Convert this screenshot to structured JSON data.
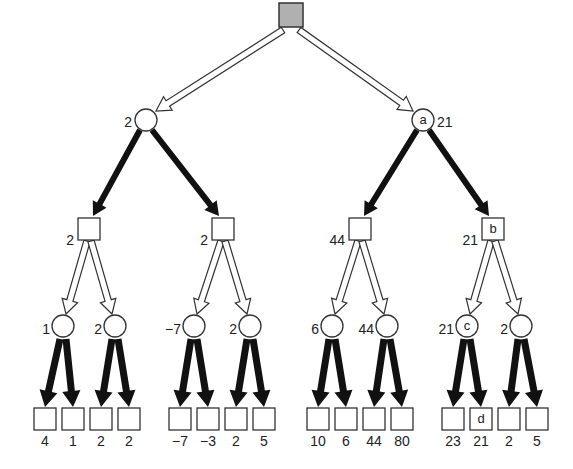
{
  "diagram": {
    "type": "minimax-game-tree",
    "root": {
      "shape": "square",
      "fill": "#b0b0b0"
    },
    "level1": [
      {
        "shape": "circle",
        "value": "2",
        "tag": ""
      },
      {
        "shape": "circle",
        "value": "21",
        "tag": "a"
      }
    ],
    "level2": [
      {
        "shape": "square",
        "value": "2",
        "tag": ""
      },
      {
        "shape": "square",
        "value": "2",
        "tag": ""
      },
      {
        "shape": "square",
        "value": "44",
        "tag": ""
      },
      {
        "shape": "square",
        "value": "21",
        "tag": "b"
      }
    ],
    "level3": [
      {
        "shape": "circle",
        "value": "1",
        "tag": ""
      },
      {
        "shape": "circle",
        "value": "2",
        "tag": ""
      },
      {
        "shape": "circle",
        "value": "−7",
        "tag": ""
      },
      {
        "shape": "circle",
        "value": "2",
        "tag": ""
      },
      {
        "shape": "circle",
        "value": "6",
        "tag": ""
      },
      {
        "shape": "circle",
        "value": "44",
        "tag": ""
      },
      {
        "shape": "circle",
        "value": "21",
        "tag": "c"
      },
      {
        "shape": "circle",
        "value": "2",
        "tag": ""
      }
    ],
    "leaves": [
      {
        "value": "4",
        "tag": ""
      },
      {
        "value": "1",
        "tag": ""
      },
      {
        "value": "2",
        "tag": ""
      },
      {
        "value": "2",
        "tag": ""
      },
      {
        "value": "−7",
        "tag": ""
      },
      {
        "value": "−3",
        "tag": ""
      },
      {
        "value": "2",
        "tag": ""
      },
      {
        "value": "5",
        "tag": ""
      },
      {
        "value": "10",
        "tag": ""
      },
      {
        "value": "6",
        "tag": ""
      },
      {
        "value": "44",
        "tag": ""
      },
      {
        "value": "80",
        "tag": ""
      },
      {
        "value": "23",
        "tag": ""
      },
      {
        "value": "21",
        "tag": "d"
      },
      {
        "value": "2",
        "tag": ""
      },
      {
        "value": "5",
        "tag": ""
      }
    ],
    "edge_styles": {
      "root_to_level1": "hollow-arrow",
      "level1_to_level2": "solid-black-arrow",
      "level2_to_level3": "hollow-arrow",
      "level3_to_leaves": "solid-black-arrow"
    }
  }
}
